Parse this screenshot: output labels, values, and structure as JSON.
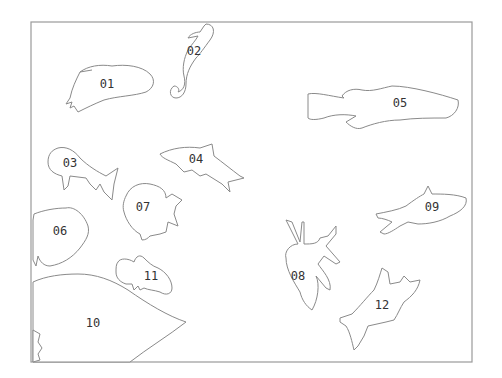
{
  "diagram": {
    "colors": {
      "stroke": "#8a8a8a",
      "label": "#333333",
      "background": "#ffffff"
    },
    "shapes": [
      {
        "id": "01",
        "label": "01",
        "kind": "fish"
      },
      {
        "id": "02",
        "label": "02",
        "kind": "seahorse"
      },
      {
        "id": "03",
        "label": "03",
        "kind": "fish"
      },
      {
        "id": "04",
        "label": "04",
        "kind": "shark"
      },
      {
        "id": "05",
        "label": "05",
        "kind": "fish"
      },
      {
        "id": "06",
        "label": "06",
        "kind": "fish"
      },
      {
        "id": "07",
        "label": "07",
        "kind": "angelfish"
      },
      {
        "id": "08",
        "label": "08",
        "kind": "lionfish"
      },
      {
        "id": "09",
        "label": "09",
        "kind": "fish"
      },
      {
        "id": "10",
        "label": "10",
        "kind": "large-fish"
      },
      {
        "id": "11",
        "label": "11",
        "kind": "clownfish"
      },
      {
        "id": "12",
        "label": "12",
        "kind": "shark"
      }
    ]
  }
}
